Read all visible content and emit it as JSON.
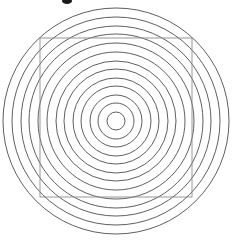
{
  "canvas": {
    "width": 233,
    "height": 241,
    "background": "#ffffff"
  },
  "figure": {
    "title": ""
  },
  "chart_data": {
    "type": "scatter",
    "title": "",
    "xlabel": "",
    "ylabel": "",
    "grid": false,
    "legend": null,
    "center": {
      "x": 116,
      "y": 121
    },
    "stroke_color": "#4d4d4d",
    "stroke_width": 0.9,
    "fill": "none",
    "circle_count": 13,
    "radii": [
      9,
      18,
      26,
      35,
      43,
      52,
      60,
      69,
      78,
      87,
      95,
      104,
      113
    ],
    "overlay_square": {
      "x": 40,
      "y": 38,
      "width": 152,
      "height": 159,
      "stroke_color": "#8c8c8c",
      "stroke_width": 0.9,
      "fill": "none"
    },
    "artifact_mark": {
      "x": 67,
      "y": 1,
      "rx": 5,
      "ry": 3,
      "color": "#1a1a1a"
    }
  }
}
